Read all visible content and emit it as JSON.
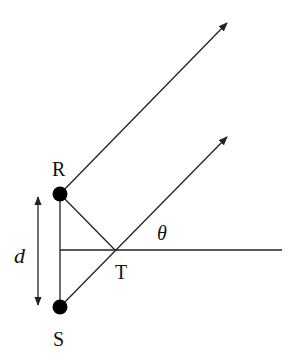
{
  "diagram": {
    "labels": {
      "R": "R",
      "S": "S",
      "T": "T",
      "d": "d",
      "theta": "θ"
    },
    "colors": {
      "stroke": "#222222",
      "point": "#000000",
      "background": "#ffffff"
    },
    "points": {
      "R": [
        60,
        194
      ],
      "S": [
        60,
        307
      ],
      "T": [
        115,
        251
      ]
    }
  }
}
